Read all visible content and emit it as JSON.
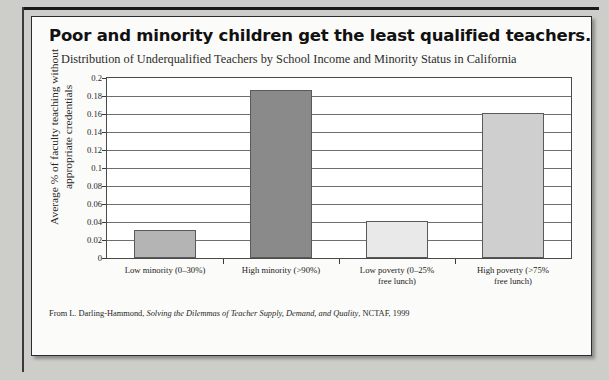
{
  "figure": {
    "title": "Poor and minority children get the least qualified teachers.",
    "subtitle": "Distribution of Underqualified Teachers by School Income and Minority Status in California",
    "source_prefix": "From L. Darling-Hammond, ",
    "source_italic": "Solving the Dilemmas of Teacher Supply, Demand, and Quality",
    "source_suffix": ", NCTAF, 1999"
  },
  "chart_data": {
    "type": "bar",
    "title": "Poor and minority children get the least qualified teachers.",
    "subtitle": "Distribution of Underqualified Teachers by School Income and Minority Status in California",
    "xlabel": "",
    "ylabel": "Average % of faculty teaching without appropriate credentials",
    "ylabel_line1": "Average % of faculty teaching without",
    "ylabel_line2": "appropriate credentials",
    "categories": [
      "Low minority (0–30%)",
      "High minority (>90%)",
      "Low poverty (0–25% free lunch)",
      "High poverty (>75% free lunch)"
    ],
    "category_lines": [
      [
        "Low minority (0–30%)"
      ],
      [
        "High minority (>90%)"
      ],
      [
        "Low poverty (0–25%",
        "free lunch)"
      ],
      [
        "High poverty (>75%",
        "free lunch)"
      ]
    ],
    "values": [
      0.031,
      0.187,
      0.041,
      0.161
    ],
    "bar_colors": [
      "#b4b4b4",
      "#8a8a8a",
      "#e9e9e9",
      "#cfcfcf"
    ],
    "ylim": [
      0,
      0.2
    ],
    "ytick_values": [
      0.2,
      0.18,
      0.16,
      0.14,
      0.12,
      0.1,
      0.08,
      0.06,
      0.04,
      0.02,
      0
    ],
    "ytick_labels": [
      "0.2",
      "0.18",
      "0.16",
      "0.14",
      "0.12",
      "0.1",
      "0.08",
      "0.06",
      "0.04",
      "0.02",
      "0"
    ],
    "grid": true,
    "legend": "none"
  }
}
